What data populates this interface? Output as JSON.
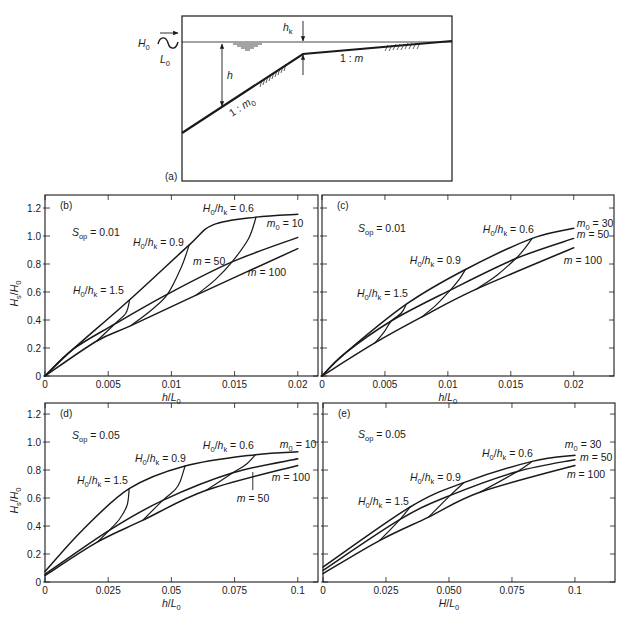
{
  "figure": {
    "panel_a": {
      "label": "(a)",
      "incident_wave_height": "H_{0}",
      "incident_wave_length": "L_{0}",
      "depth_label": "h",
      "berm_depth_label": "h_{k}",
      "offshore_slope_label": "1 : m_{0}",
      "inshore_slope_label": "1 : m"
    }
  },
  "chart_data": [
    {
      "panel": "b",
      "panel_label": "(b)",
      "type": "line",
      "title": "",
      "xlabel": "h/L_{0}",
      "ylabel": "H_{s}/H_{0}",
      "xlim": [
        0,
        0.0216
      ],
      "ylim": [
        0,
        1.293
      ],
      "xticks": [
        0,
        0.005,
        0.01,
        0.015,
        0.02
      ],
      "xticklabels": [
        "0",
        "0.005",
        "0.01",
        "0.015",
        "0.02"
      ],
      "yticks": [
        0,
        0.2,
        0.4,
        0.6,
        0.8,
        1.0,
        1.2
      ],
      "yticklabels": [
        "0",
        "0.2",
        "0.4",
        "0.6",
        "0.8",
        "1.0",
        "1.2"
      ],
      "grid": false,
      "parameters": {
        "S_op": 0.01,
        "m0": 10
      },
      "series": [
        {
          "name": "m_{0} = 10",
          "group": "slope",
          "points": [
            [
              0,
              0
            ],
            [
              0.0022,
              0.19
            ],
            [
              0.0067,
              0.545
            ],
            [
              0.0114,
              0.935
            ],
            [
              0.0133,
              1.08
            ],
            [
              0.0167,
              1.135
            ],
            [
              0.02,
              1.155
            ]
          ]
        },
        {
          "name": "m = 50",
          "group": "slope",
          "points": [
            [
              0,
              0
            ],
            [
              0.0022,
              0.19
            ],
            [
              0.0055,
              0.37
            ],
            [
              0.0097,
              0.585
            ],
            [
              0.0148,
              0.815
            ],
            [
              0.02,
              0.99
            ]
          ]
        },
        {
          "name": "m = 100",
          "group": "slope",
          "points": [
            [
              0,
              0
            ],
            [
              0.0041,
              0.25
            ],
            [
              0.0068,
              0.36
            ],
            [
              0.012,
              0.58
            ],
            [
              0.02,
              0.91
            ]
          ]
        },
        {
          "name": "H_{0}/h_{k} = 1.5",
          "group": "breaking",
          "points": [
            [
              0.0067,
              0.545
            ],
            [
              0.0064,
              0.45
            ],
            [
              0.0055,
              0.37
            ],
            [
              0.0041,
              0.25
            ]
          ]
        },
        {
          "name": "H_{0}/h_{k} = 0.9",
          "group": "breaking",
          "points": [
            [
              0.0114,
              0.935
            ],
            [
              0.0108,
              0.78
            ],
            [
              0.0097,
              0.585
            ],
            [
              0.0084,
              0.47
            ],
            [
              0.0068,
              0.36
            ]
          ]
        },
        {
          "name": "H_{0}/h_{k} = 0.6",
          "group": "breaking",
          "points": [
            [
              0.0167,
              1.135
            ],
            [
              0.0161,
              0.98
            ],
            [
              0.0148,
              0.815
            ],
            [
              0.0135,
              0.69
            ],
            [
              0.012,
              0.58
            ]
          ]
        }
      ],
      "annotations": [
        {
          "text": "S_{op} = 0.01",
          "at": [
            0.00213,
            1.0
          ]
        },
        {
          "text": "H_{0}/h_{k} = 0.6",
          "at": [
            0.01249,
            1.171
          ]
        },
        {
          "text": "m_{0} = 10",
          "at": [
            0.01755,
            1.064
          ]
        },
        {
          "text": "H_{0}/h_{k} = 0.9",
          "at": [
            0.00696,
            0.929
          ]
        },
        {
          "text": "m = 50",
          "at": [
            0.0117,
            0.793
          ]
        },
        {
          "text": "m = 100",
          "at": [
            0.01605,
            0.714
          ]
        },
        {
          "text": "H_{0}/h_{k} = 1.5",
          "at": [
            0.00221,
            0.586
          ]
        }
      ],
      "leaders": []
    },
    {
      "panel": "c",
      "panel_label": "(c)",
      "type": "line",
      "title": "",
      "xlabel": "h/L_{0}",
      "ylabel": "",
      "xlim": [
        0,
        0.0232
      ],
      "ylim": [
        0,
        1.293
      ],
      "xticks": [
        0,
        0.005,
        0.01,
        0.015,
        0.02
      ],
      "xticklabels": [
        "0",
        "0.005",
        "0.01",
        "0.015",
        "0.02"
      ],
      "yticks": [
        0,
        0.2,
        0.4,
        0.6,
        0.8,
        1.0,
        1.2
      ],
      "yticklabels": [],
      "grid": false,
      "parameters": {
        "S_op": 0.01,
        "m0": 30
      },
      "series": [
        {
          "name": "m_{0} = 30",
          "group": "slope",
          "points": [
            [
              0,
              0
            ],
            [
              0.0018,
              0.16
            ],
            [
              0.0067,
              0.513
            ],
            [
              0.0114,
              0.761
            ],
            [
              0.0167,
              0.983
            ],
            [
              0.02,
              1.055
            ]
          ]
        },
        {
          "name": "m = 50",
          "group": "slope",
          "points": [
            [
              0,
              0
            ],
            [
              0.0018,
              0.16
            ],
            [
              0.0055,
              0.393
            ],
            [
              0.0102,
              0.614
            ],
            [
              0.0154,
              0.839
            ],
            [
              0.02,
              0.983
            ]
          ]
        },
        {
          "name": "m = 100",
          "group": "slope",
          "points": [
            [
              0,
              0
            ],
            [
              0.0042,
              0.236
            ],
            [
              0.0079,
              0.42
            ],
            [
              0.0123,
              0.622
            ],
            [
              0.02,
              0.916
            ]
          ]
        },
        {
          "name": "H_{0}/h_{k} = 1.5",
          "group": "breaking",
          "points": [
            [
              0.0067,
              0.513
            ],
            [
              0.0063,
              0.45
            ],
            [
              0.0055,
              0.393
            ],
            [
              0.0049,
              0.31
            ],
            [
              0.0042,
              0.236
            ]
          ]
        },
        {
          "name": "H_{0}/h_{k} = 0.9",
          "group": "breaking",
          "points": [
            [
              0.0114,
              0.761
            ],
            [
              0.0109,
              0.69
            ],
            [
              0.0102,
              0.614
            ],
            [
              0.0091,
              0.51
            ],
            [
              0.0079,
              0.42
            ]
          ]
        },
        {
          "name": "H_{0}/h_{k} = 0.6",
          "group": "breaking",
          "points": [
            [
              0.0167,
              0.983
            ],
            [
              0.0161,
              0.91
            ],
            [
              0.0154,
              0.839
            ],
            [
              0.0139,
              0.72
            ],
            [
              0.0123,
              0.622
            ]
          ]
        }
      ],
      "annotations": [
        {
          "text": "S_{op} = 0.01",
          "at": [
            0.00286,
            1.029
          ]
        },
        {
          "text": "H_{0}/h_{k} = 0.6",
          "at": [
            0.01278,
            1.021
          ]
        },
        {
          "text": "H_{0}/h_{k} = 0.9",
          "at": [
            0.00698,
            0.8
          ]
        },
        {
          "text": "H_{0}/h_{k} = 1.5",
          "at": [
            0.00278,
            0.564
          ]
        },
        {
          "text": "m_{0} = 30",
          "at": [
            0.02024,
            1.064
          ]
        },
        {
          "text": "m = 50",
          "at": [
            0.02024,
            0.986
          ]
        },
        {
          "text": "m = 100",
          "at": [
            0.01921,
            0.8
          ]
        }
      ],
      "leaders": []
    },
    {
      "panel": "d",
      "panel_label": "(d)",
      "type": "line",
      "title": "",
      "xlabel": "h/L_{0}",
      "ylabel": "H_{s}/H_{0}",
      "xlim": [
        0,
        0.108
      ],
      "ylim": [
        0,
        1.279
      ],
      "xticks": [
        0,
        0.025,
        0.05,
        0.075,
        0.1
      ],
      "xticklabels": [
        "0",
        "0.025",
        "0.05",
        "0.075",
        "0.1"
      ],
      "yticks": [
        0,
        0.2,
        0.4,
        0.6,
        0.8,
        1.0,
        1.2
      ],
      "yticklabels": [
        "0",
        "0.2",
        "0.4",
        "0.6",
        "0.8",
        "1.0",
        "1.2"
      ],
      "grid": false,
      "parameters": {
        "S_op": 0.05,
        "m0": 10
      },
      "series": [
        {
          "name": "m_{0} = 10",
          "group": "slope",
          "points": [
            [
              0,
              0.075
            ],
            [
              0.0148,
              0.37
            ],
            [
              0.0333,
              0.667
            ],
            [
              0.0554,
              0.829
            ],
            [
              0.0833,
              0.91
            ],
            [
              0.1,
              0.93
            ]
          ]
        },
        {
          "name": "m = 50",
          "group": "slope",
          "points": [
            [
              0,
              0.055
            ],
            [
              0.0254,
              0.369
            ],
            [
              0.0466,
              0.583
            ],
            [
              0.0743,
              0.78
            ],
            [
              0.1,
              0.88
            ]
          ]
        },
        {
          "name": "m = 100",
          "group": "slope",
          "points": [
            [
              0,
              0.045
            ],
            [
              0.0208,
              0.286
            ],
            [
              0.0386,
              0.44
            ],
            [
              0.0638,
              0.655
            ],
            [
              0.1,
              0.833
            ]
          ]
        },
        {
          "name": "H_{0}/h_{k} = 1.5",
          "group": "breaking",
          "points": [
            [
              0.0333,
              0.667
            ],
            [
              0.0325,
              0.55
            ],
            [
              0.0295,
              0.45
            ],
            [
              0.0254,
              0.369
            ],
            [
              0.0208,
              0.286
            ]
          ]
        },
        {
          "name": "H_{0}/h_{k} = 0.9",
          "group": "breaking",
          "points": [
            [
              0.0554,
              0.829
            ],
            [
              0.0535,
              0.72
            ],
            [
              0.0515,
              0.66
            ],
            [
              0.0466,
              0.583
            ],
            [
              0.0386,
              0.44
            ]
          ]
        },
        {
          "name": "H_{0}/h_{k} = 0.6",
          "group": "breaking",
          "points": [
            [
              0.0833,
              0.91
            ],
            [
              0.0795,
              0.84
            ],
            [
              0.0743,
              0.78
            ],
            [
              0.0638,
              0.655
            ]
          ]
        }
      ],
      "annotations": [
        {
          "text": "S_{op} = 0.05",
          "at": [
            0.01067,
            1.021
          ]
        },
        {
          "text": "H_{0}/h_{k} = 0.6",
          "at": [
            0.06245,
            0.95
          ]
        },
        {
          "text": "m_{0} = 10",
          "at": [
            0.0929,
            0.957
          ]
        },
        {
          "text": "H_{0}/h_{k} = 0.9",
          "at": [
            0.03557,
            0.857
          ]
        },
        {
          "text": "H_{0}/h_{k} = 1.5",
          "at": [
            0.01265,
            0.7
          ]
        },
        {
          "text": "m = 100",
          "at": [
            0.0897,
            0.721
          ]
        },
        {
          "text": "m = 50",
          "at": [
            0.0759,
            0.571
          ]
        }
      ],
      "leaders": [
        {
          "label": "m = 50",
          "from": [
            0.0822,
            0.786
          ],
          "to": [
            0.0822,
            0.657
          ]
        }
      ]
    },
    {
      "panel": "e",
      "panel_label": "(e)",
      "type": "line",
      "title": "",
      "xlabel": "H/L_{0}",
      "ylabel": "",
      "xlim": [
        0,
        0.1159
      ],
      "ylim": [
        0,
        1.279
      ],
      "xticks": [
        0,
        0.025,
        0.05,
        0.075,
        0.1
      ],
      "xticklabels": [
        "0",
        "0.025",
        "0.050",
        "0.075",
        "0.1"
      ],
      "yticks": [
        0,
        0.2,
        0.4,
        0.6,
        0.8,
        1.0,
        1.2
      ],
      "yticklabels": [],
      "grid": false,
      "parameters": {
        "S_op": 0.05,
        "m0": 30
      },
      "series": [
        {
          "name": "m_{0} = 30",
          "group": "slope",
          "points": [
            [
              0,
              0.107
            ],
            [
              0.0346,
              0.536
            ],
            [
              0.0559,
              0.71
            ],
            [
              0.0831,
              0.862
            ],
            [
              0.1,
              0.905
            ]
          ]
        },
        {
          "name": "m = 50",
          "group": "slope",
          "points": [
            [
              0,
              0.083
            ],
            [
              0.0306,
              0.448
            ],
            [
              0.0505,
              0.619
            ],
            [
              0.0772,
              0.79
            ],
            [
              0.1,
              0.874
            ]
          ]
        },
        {
          "name": "m = 100",
          "group": "slope",
          "points": [
            [
              0,
              0.06
            ],
            [
              0.0226,
              0.298
            ],
            [
              0.0419,
              0.464
            ],
            [
              0.0625,
              0.643
            ],
            [
              0.1,
              0.833
            ]
          ]
        },
        {
          "name": "H_{0}/h_{k} = 1.5",
          "group": "breaking",
          "points": [
            [
              0.0346,
              0.536
            ],
            [
              0.0306,
              0.448
            ],
            [
              0.0226,
              0.298
            ]
          ]
        },
        {
          "name": "H_{0}/h_{k} = 0.9",
          "group": "breaking",
          "points": [
            [
              0.0559,
              0.71
            ],
            [
              0.0505,
              0.619
            ],
            [
              0.0419,
              0.464
            ]
          ]
        },
        {
          "name": "H_{0}/h_{k} = 0.6",
          "group": "breaking",
          "points": [
            [
              0.0831,
              0.862
            ],
            [
              0.0772,
              0.79
            ],
            [
              0.0625,
              0.643
            ]
          ]
        }
      ],
      "annotations": [
        {
          "text": "S_{op} = 0.05",
          "at": [
            0.01389,
            1.029
          ]
        },
        {
          "text": "H_{0}/h_{k} = 0.6",
          "at": [
            0.0631,
            0.893
          ]
        },
        {
          "text": "m_{0} = 30",
          "at": [
            0.096,
            0.957
          ]
        },
        {
          "text": "m = 50",
          "at": [
            0.102,
            0.864
          ]
        },
        {
          "text": "m = 100",
          "at": [
            0.0968,
            0.743
          ]
        },
        {
          "text": "H_{0}/h_{k} = 0.9",
          "at": [
            0.0345,
            0.721
          ]
        },
        {
          "text": "H_{0}/h_{k} = 1.5",
          "at": [
            0.0139,
            0.55
          ]
        }
      ],
      "leaders": []
    }
  ]
}
